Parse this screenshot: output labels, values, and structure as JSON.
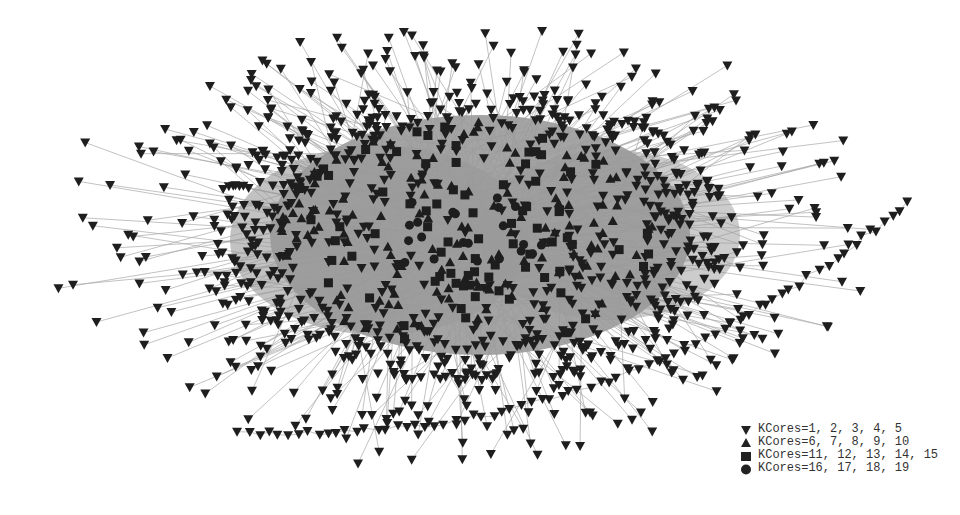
{
  "figure": {
    "type": "network-graph",
    "background": "#ffffff",
    "edge_color": "#a8a8a8",
    "node_color": "#1e1e1e",
    "core_fill_color": "#9a9a9a"
  },
  "legend": {
    "items": [
      {
        "marker": "triangle-down",
        "label": "KCores=1, 2, 3, 4, 5"
      },
      {
        "marker": "triangle-up",
        "label": "KCores=6, 7, 8, 9, 10"
      },
      {
        "marker": "square",
        "label": "KCores=11, 12, 13, 14, 15"
      },
      {
        "marker": "circle",
        "label": "KCores=16, 17, 18, 19"
      }
    ]
  },
  "layout": {
    "core_center": [
      470,
      235
    ],
    "core_radius": [
      190,
      115
    ],
    "outer_radius": [
      420,
      220
    ],
    "tail_arc_end": [
      915,
      200
    ]
  }
}
